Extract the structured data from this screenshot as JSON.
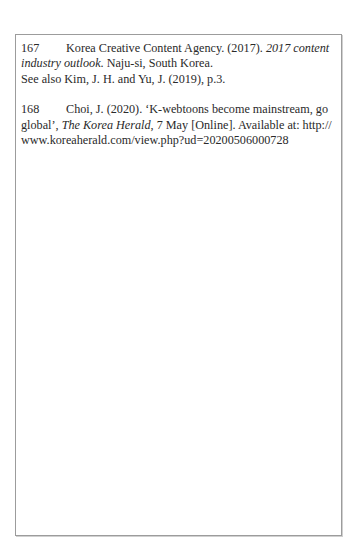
{
  "footnotes": [
    {
      "number": "167",
      "line1_pre": "Korea Creative Content Agency. (2017). ",
      "line1_italic": "2017 content",
      "line2_italic": "industry outlook",
      "line2_post": ". Naju-si, South Korea.",
      "line3": "See also Kim, J. H. and Yu, J. (2019), p.3."
    },
    {
      "number": "168",
      "line1": "Choi, J. (2020). ‘K-webtoons become mainstream, go",
      "line2_pre": "global’, ",
      "line2_italic": "The Korea Herald",
      "line2_post": ", 7 May [Online]. Available at: http://",
      "line3": "www.koreaherald.com/view.php?ud=20200506000728"
    }
  ]
}
